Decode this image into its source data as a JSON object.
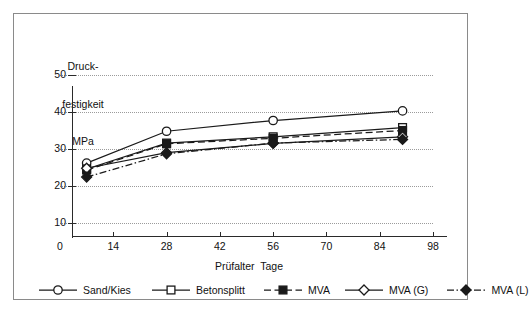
{
  "chart_data": {
    "type": "line",
    "title": "",
    "ylabel": "Druck-\nfestigkeit\nMPa",
    "ylabel_lines": [
      "Druck-",
      "festigkeit",
      "MPa"
    ],
    "xlabel": "Prüfalter  Tage",
    "xlim": [
      0,
      98
    ],
    "ylim": [
      10,
      50
    ],
    "xticks": [
      0,
      14,
      28,
      42,
      56,
      70,
      84,
      98
    ],
    "xtick_labels": [
      "0",
      "14",
      "28",
      "42",
      "56",
      "70",
      "84",
      "98"
    ],
    "yticks": [
      10,
      20,
      30,
      40,
      50
    ],
    "ytick_labels": [
      "10",
      "20",
      "30",
      "40",
      "50"
    ],
    "grid": "horizontal-dotted",
    "legend_position": "bottom",
    "x": [
      7,
      28,
      56,
      90
    ],
    "series": [
      {
        "name": "Sand/Kies",
        "values": [
          26.2,
          34.8,
          37.7,
          40.3
        ],
        "marker": "open-circle",
        "line": "solid",
        "color": "#1a1a1a"
      },
      {
        "name": "Betonsplitt",
        "values": [
          24.6,
          31.6,
          33.3,
          35.8
        ],
        "marker": "open-square",
        "line": "solid",
        "color": "#1a1a1a"
      },
      {
        "name": "MVA",
        "values": [
          24.3,
          31.4,
          32.9,
          35.0
        ],
        "marker": "filled-square",
        "line": "dashed",
        "color": "#1a1a1a"
      },
      {
        "name": "MVA (G)",
        "values": [
          24.8,
          29.0,
          31.5,
          33.3
        ],
        "marker": "open-diamond",
        "line": "solid",
        "color": "#1a1a1a"
      },
      {
        "name": "MVA (L)",
        "values": [
          22.4,
          28.7,
          31.6,
          32.6
        ],
        "marker": "filled-diamond",
        "line": "dash-dot",
        "color": "#1a1a1a"
      }
    ]
  },
  "legend": {
    "items": [
      {
        "label": "Sand/Kies"
      },
      {
        "label": "Betonsplitt"
      },
      {
        "label": "MVA"
      },
      {
        "label": "MVA (G)"
      },
      {
        "label": "MVA (L)"
      }
    ]
  }
}
